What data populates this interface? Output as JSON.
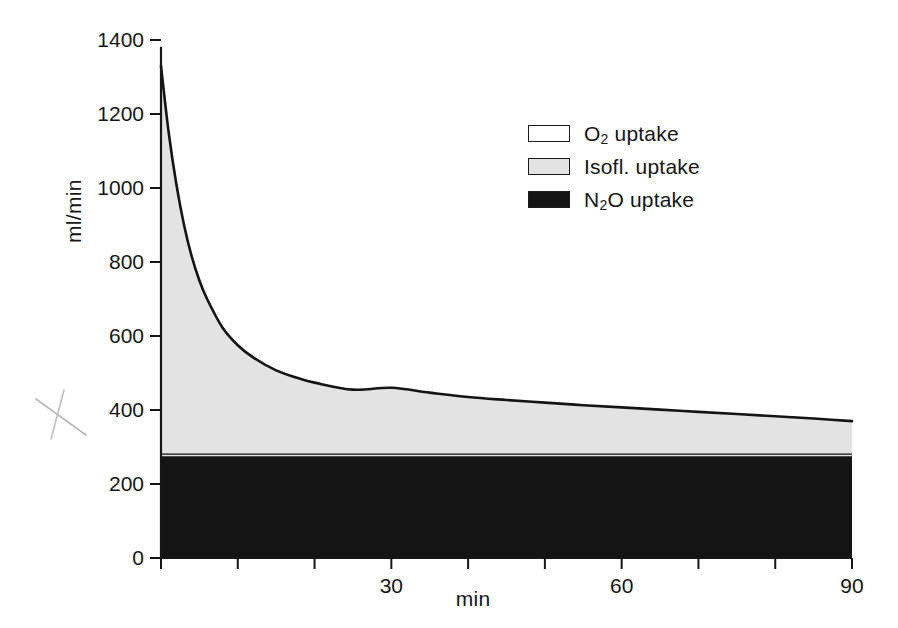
{
  "chart_data": {
    "type": "area",
    "title": "",
    "subtitle": "",
    "xlabel": "min",
    "ylabel": "ml/min",
    "xlim": [
      0,
      90
    ],
    "ylim": [
      0,
      1400
    ],
    "grid": false,
    "stacked": true,
    "legend_position": "inside-top-right",
    "x_tick_labels": [
      "0",
      "30",
      "60",
      "90"
    ],
    "x_tick_values": [
      0,
      30,
      60,
      90
    ],
    "x_minor_tick_values": [
      10,
      20,
      40,
      50,
      70,
      80
    ],
    "y_tick_labels": [
      "0",
      "200",
      "400",
      "600",
      "800",
      "1000",
      "1200",
      "1400"
    ],
    "y_tick_values": [
      0,
      200,
      400,
      600,
      800,
      1000,
      1200,
      1400
    ],
    "legend": [
      {
        "name": "O2 uptake",
        "label_html": "O<sub>2</sub> uptake",
        "color": "#ffffff"
      },
      {
        "name": "Isofl. uptake",
        "label_html": "Isofl. uptake",
        "color": "#e3e3e3"
      },
      {
        "name": "N2O uptake",
        "label_html": "N<sub>2</sub>O uptake",
        "color": "#141414"
      }
    ],
    "x": [
      0,
      1,
      2,
      3,
      4,
      5,
      6,
      8,
      10,
      12,
      15,
      18,
      20,
      25,
      30,
      35,
      40,
      45,
      50,
      55,
      60,
      65,
      70,
      75,
      80,
      85,
      90
    ],
    "series": [
      {
        "name": "N2O uptake",
        "color": "#141414",
        "values": [
          275,
          275,
          275,
          275,
          275,
          275,
          275,
          275,
          275,
          275,
          275,
          275,
          275,
          275,
          275,
          275,
          275,
          275,
          275,
          275,
          275,
          275,
          275,
          275,
          275,
          275,
          275
        ]
      },
      {
        "name": "Isofl. uptake",
        "color": "#e3e3e3",
        "comment": "band thickness = total curve minus N2O baseline",
        "values": [
          1055,
          875,
          735,
          625,
          540,
          475,
          425,
          348,
          300,
          267,
          232,
          210,
          199,
          180,
          185,
          172,
          160,
          152,
          145,
          138,
          132,
          126,
          120,
          114,
          108,
          102,
          95
        ]
      }
    ],
    "total_curve": {
      "name": "Total uptake (O2 boundary)",
      "comment": "upper envelope of stacked areas; exponential decay",
      "values": [
        1330,
        1150,
        1010,
        900,
        815,
        750,
        700,
        623,
        575,
        542,
        507,
        485,
        474,
        455,
        460,
        447,
        435,
        427,
        420,
        413,
        407,
        401,
        395,
        389,
        383,
        377,
        370
      ]
    }
  },
  "annotations": {
    "pencil_mark": "hand-drawn-x"
  },
  "axis": {
    "ylabel": "ml/min",
    "xlabel": "min"
  }
}
